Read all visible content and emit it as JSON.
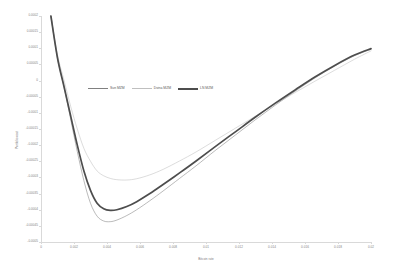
{
  "chart_data": {
    "type": "line",
    "title": "",
    "xlabel": "Bitcoin rate",
    "ylabel": "Portfolio cost",
    "xlim": [
      0,
      0.02
    ],
    "ylim": [
      -0.0005,
      0.0002
    ],
    "grid": false,
    "legend_position": "inside-upper-center",
    "x_ticks": [
      "0",
      "0.002",
      "0.004",
      "0.006",
      "0.008",
      "0.01",
      "0.012",
      "0.014",
      "0.016",
      "0.018",
      "0.02"
    ],
    "y_ticks": [
      "0.0002",
      "0.00015",
      "0.0001",
      "0.00005",
      "0",
      "-0.00005",
      "-0.0001",
      "-0.00015",
      "-0.0002",
      "-0.00025",
      "-0.0003",
      "-0.00035",
      "-0.0004",
      "-0.00045",
      "-0.0005"
    ],
    "colors": {
      "sun": "#808080",
      "dvina": "#bfbfbf",
      "ln": "#4d4d4d",
      "axis": "#d9d9d9",
      "text": "#7f7f7f"
    },
    "series": [
      {
        "name": "Sun MZM",
        "x": [
          0.0006,
          0.001,
          0.0014,
          0.0018,
          0.0022,
          0.0026,
          0.003,
          0.0034,
          0.0038,
          0.0042,
          0.0046,
          0.0052,
          0.0058,
          0.0066,
          0.0074,
          0.0084,
          0.0094,
          0.0106,
          0.0118,
          0.013,
          0.0142,
          0.0154,
          0.0166,
          0.0178,
          0.019,
          0.02
        ],
        "values": [
          0.0002,
          7e-05,
          -2e-05,
          -0.00012,
          -0.00022,
          -0.00031,
          -0.00038,
          -0.00042,
          -0.000435,
          -0.000437,
          -0.000432,
          -0.000418,
          -0.0004,
          -0.000372,
          -0.000342,
          -0.000303,
          -0.000264,
          -0.000215,
          -0.000168,
          -0.000121,
          -7.6e-05,
          -3.3e-05,
          8e-06,
          4.5e-05,
          7.7e-05,
          9.7e-05
        ]
      },
      {
        "name": "Dvina MZM",
        "x": [
          0.0006,
          0.001,
          0.0014,
          0.0018,
          0.0022,
          0.0026,
          0.003,
          0.0034,
          0.0038,
          0.0042,
          0.0046,
          0.0052,
          0.0058,
          0.0066,
          0.0074,
          0.0084,
          0.0094,
          0.0106,
          0.0118,
          0.013,
          0.0142,
          0.0154,
          0.0166,
          0.0178,
          0.019,
          0.02
        ],
        "values": [
          0.0002,
          8e-05,
          0.0,
          -8e-05,
          -0.00015,
          -0.00021,
          -0.00025,
          -0.00028,
          -0.000295,
          -0.000303,
          -0.000307,
          -0.000308,
          -0.000304,
          -0.000292,
          -0.000275,
          -0.000249,
          -0.000221,
          -0.000184,
          -0.000147,
          -0.00011,
          -7.3e-05,
          -3.7e-05,
          -2e-06,
          3.2e-05,
          6.6e-05,
          9.2e-05
        ]
      },
      {
        "name": "LN MZM",
        "x": [
          0.0006,
          0.001,
          0.0014,
          0.0018,
          0.0022,
          0.0026,
          0.003,
          0.0034,
          0.0038,
          0.0042,
          0.0046,
          0.0052,
          0.0058,
          0.0066,
          0.0074,
          0.0084,
          0.0094,
          0.0106,
          0.0118,
          0.013,
          0.0142,
          0.0154,
          0.0166,
          0.0178,
          0.019,
          0.02
        ],
        "values": [
          0.0002,
          7e-05,
          -2e-05,
          -0.00011,
          -0.0002,
          -0.00028,
          -0.00034,
          -0.00038,
          -0.000397,
          -0.000402,
          -0.0004,
          -0.00039,
          -0.000375,
          -0.00035,
          -0.000322,
          -0.000286,
          -0.000249,
          -0.000203,
          -0.000158,
          -0.000113,
          -7e-05,
          -2.9e-05,
          1.1e-05,
          4.7e-05,
          7.9e-05,
          9.9e-05
        ]
      }
    ]
  },
  "legend": {
    "items": [
      {
        "label": "Sun MZM"
      },
      {
        "label": "Dvina MZM"
      },
      {
        "label": "LN MZM"
      }
    ]
  },
  "axes": {
    "x_title": "Bitcoin rate",
    "y_title": "Portfolio cost"
  }
}
